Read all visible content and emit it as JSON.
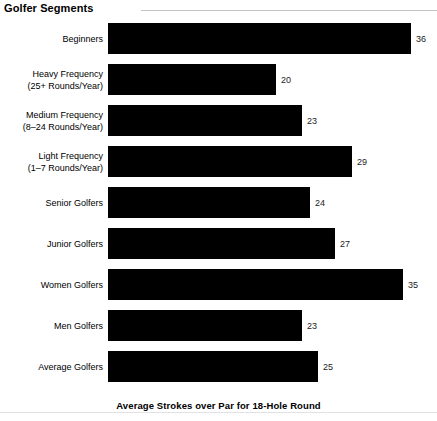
{
  "chart_data": {
    "type": "bar",
    "orientation": "horizontal",
    "title": "Golfer Segments",
    "xlabel": "Average Strokes over Par for 18-Hole Round",
    "ylabel": "",
    "grid": false,
    "legend": null,
    "xlim": [
      0,
      36
    ],
    "axis_max": 36,
    "categories": [
      "Beginners",
      "Heavy Frequency (25+ Rounds/Year)",
      "Medium Frequency (8–24 Rounds/Year)",
      "Light Frequency (1–7 Rounds/Year)",
      "Senior Golfers",
      "Junior Golfers",
      "Women Golfers",
      "Men Golfers",
      "Average Golfers"
    ],
    "values": [
      36,
      20,
      23,
      29,
      24,
      27,
      35,
      23,
      25
    ],
    "bar_color": "#000000",
    "background_color": "#ffffff",
    "bars": [
      {
        "line1": "Beginners",
        "line2": "",
        "value": 36,
        "value_label": "36"
      },
      {
        "line1": "Heavy Frequency",
        "line2": "(25+ Rounds/Year)",
        "value": 20,
        "value_label": "20"
      },
      {
        "line1": "Medium Frequency",
        "line2": "(8–24 Rounds/Year)",
        "value": 23,
        "value_label": "23"
      },
      {
        "line1": "Light Frequency",
        "line2": "(1–7 Rounds/Year)",
        "value": 29,
        "value_label": "29"
      },
      {
        "line1": "Senior Golfers",
        "line2": "",
        "value": 24,
        "value_label": "24"
      },
      {
        "line1": "Junior Golfers",
        "line2": "",
        "value": 27,
        "value_label": "27"
      },
      {
        "line1": "Women Golfers",
        "line2": "",
        "value": 35,
        "value_label": "35"
      },
      {
        "line1": "Men Golfers",
        "line2": "",
        "value": 23,
        "value_label": "23"
      },
      {
        "line1": "Average Golfers",
        "line2": "",
        "value": 25,
        "value_label": "25"
      }
    ]
  }
}
